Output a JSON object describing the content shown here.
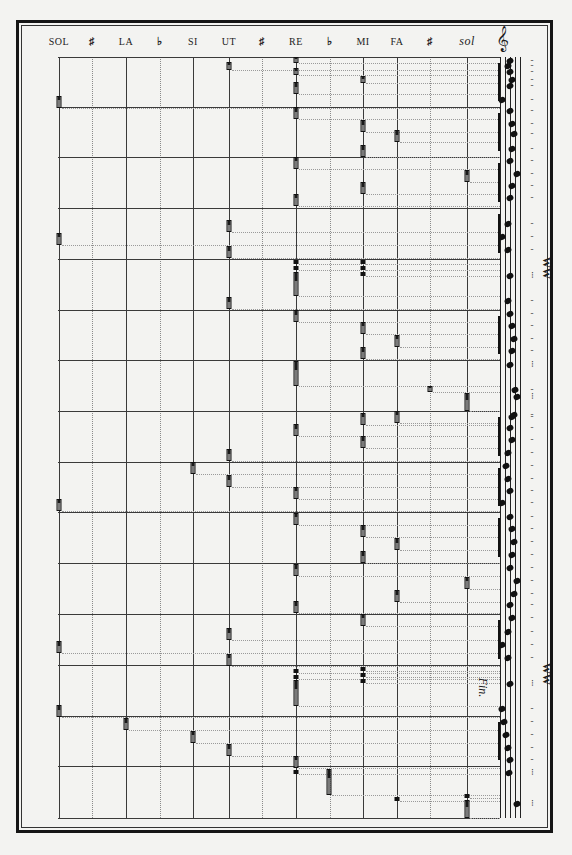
{
  "header": {
    "columns": [
      {
        "label": "SOL",
        "x": 59,
        "kind": "natural"
      },
      {
        "label": "♯",
        "x": 92,
        "kind": "accidental"
      },
      {
        "label": "LA",
        "x": 126,
        "kind": "natural"
      },
      {
        "label": "♭",
        "x": 160,
        "kind": "accidental"
      },
      {
        "label": "SI",
        "x": 193,
        "kind": "natural"
      },
      {
        "label": "UT",
        "x": 229,
        "kind": "natural"
      },
      {
        "label": "♯",
        "x": 262,
        "kind": "accidental"
      },
      {
        "label": "RE",
        "x": 296,
        "kind": "natural"
      },
      {
        "label": "♭",
        "x": 330,
        "kind": "accidental"
      },
      {
        "label": "MI",
        "x": 363,
        "kind": "natural"
      },
      {
        "label": "FA",
        "x": 397,
        "kind": "natural"
      },
      {
        "label": "♯",
        "x": 430,
        "kind": "accidental"
      },
      {
        "label": "sol",
        "x": 467,
        "kind": "italic"
      }
    ]
  },
  "grid": {
    "measure_lines_y": [
      57,
      107,
      157,
      208,
      259,
      310,
      360,
      411,
      462,
      512,
      563,
      614,
      665,
      716,
      766,
      818
    ],
    "solid_columns_x": [
      59,
      126,
      193,
      229,
      296,
      363,
      397,
      467,
      500
    ],
    "dotted_columns_x": [
      92,
      160,
      262,
      330,
      430
    ]
  },
  "pins": [
    {
      "x": 229,
      "y": 62,
      "h": 8
    },
    {
      "x": 296,
      "y": 57,
      "h": 6
    },
    {
      "x": 296,
      "y": 68,
      "h": 7
    },
    {
      "x": 296,
      "y": 82,
      "h": 12
    },
    {
      "x": 363,
      "y": 76,
      "h": 7
    },
    {
      "x": 59,
      "y": 96,
      "h": 12
    },
    {
      "x": 296,
      "y": 107,
      "h": 12
    },
    {
      "x": 363,
      "y": 120,
      "h": 12
    },
    {
      "x": 363,
      "y": 145,
      "h": 12
    },
    {
      "x": 397,
      "y": 130,
      "h": 12
    },
    {
      "x": 296,
      "y": 157,
      "h": 12
    },
    {
      "x": 363,
      "y": 182,
      "h": 12
    },
    {
      "x": 467,
      "y": 170,
      "h": 12
    },
    {
      "x": 296,
      "y": 194,
      "h": 12
    },
    {
      "x": 229,
      "y": 220,
      "h": 12
    },
    {
      "x": 229,
      "y": 246,
      "h": 12
    },
    {
      "x": 59,
      "y": 233,
      "h": 12
    },
    {
      "x": 296,
      "y": 260,
      "h": 4,
      "type": "dot"
    },
    {
      "x": 296,
      "y": 266,
      "h": 4,
      "type": "dot"
    },
    {
      "x": 296,
      "y": 272,
      "h": 24
    },
    {
      "x": 363,
      "y": 260,
      "h": 4,
      "type": "dot"
    },
    {
      "x": 363,
      "y": 266,
      "h": 4,
      "type": "dot"
    },
    {
      "x": 363,
      "y": 272,
      "h": 4,
      "type": "dot"
    },
    {
      "x": 229,
      "y": 297,
      "h": 12
    },
    {
      "x": 296,
      "y": 310,
      "h": 12
    },
    {
      "x": 363,
      "y": 322,
      "h": 12
    },
    {
      "x": 363,
      "y": 347,
      "h": 12
    },
    {
      "x": 397,
      "y": 335,
      "h": 12
    },
    {
      "x": 296,
      "y": 361,
      "h": 25
    },
    {
      "x": 430,
      "y": 386,
      "h": 6
    },
    {
      "x": 467,
      "y": 393,
      "h": 18
    },
    {
      "x": 296,
      "y": 424,
      "h": 12
    },
    {
      "x": 363,
      "y": 413,
      "h": 12
    },
    {
      "x": 363,
      "y": 436,
      "h": 12
    },
    {
      "x": 397,
      "y": 411,
      "h": 12
    },
    {
      "x": 229,
      "y": 449,
      "h": 12
    },
    {
      "x": 229,
      "y": 475,
      "h": 12
    },
    {
      "x": 193,
      "y": 462,
      "h": 12
    },
    {
      "x": 59,
      "y": 499,
      "h": 12
    },
    {
      "x": 296,
      "y": 487,
      "h": 12
    },
    {
      "x": 296,
      "y": 513,
      "h": 12
    },
    {
      "x": 363,
      "y": 525,
      "h": 12
    },
    {
      "x": 363,
      "y": 551,
      "h": 12
    },
    {
      "x": 397,
      "y": 538,
      "h": 12
    },
    {
      "x": 296,
      "y": 564,
      "h": 12
    },
    {
      "x": 467,
      "y": 577,
      "h": 12
    },
    {
      "x": 397,
      "y": 590,
      "h": 12
    },
    {
      "x": 296,
      "y": 601,
      "h": 12
    },
    {
      "x": 363,
      "y": 614,
      "h": 12
    },
    {
      "x": 229,
      "y": 628,
      "h": 12
    },
    {
      "x": 229,
      "y": 654,
      "h": 12
    },
    {
      "x": 59,
      "y": 641,
      "h": 12
    },
    {
      "x": 296,
      "y": 669,
      "h": 4,
      "type": "dot"
    },
    {
      "x": 296,
      "y": 675,
      "h": 4,
      "type": "dot"
    },
    {
      "x": 296,
      "y": 680,
      "h": 26
    },
    {
      "x": 363,
      "y": 667,
      "h": 4,
      "type": "dot"
    },
    {
      "x": 363,
      "y": 673,
      "h": 4,
      "type": "dot"
    },
    {
      "x": 363,
      "y": 679,
      "h": 4,
      "type": "dot"
    },
    {
      "x": 59,
      "y": 705,
      "h": 12
    },
    {
      "x": 126,
      "y": 718,
      "h": 12
    },
    {
      "x": 193,
      "y": 731,
      "h": 12
    },
    {
      "x": 229,
      "y": 744,
      "h": 12
    },
    {
      "x": 296,
      "y": 756,
      "h": 12
    },
    {
      "x": 296,
      "y": 770,
      "h": 4,
      "type": "dot"
    },
    {
      "x": 329,
      "y": 769,
      "h": 26
    },
    {
      "x": 397,
      "y": 797,
      "h": 4,
      "type": "dot"
    },
    {
      "x": 467,
      "y": 794,
      "h": 4,
      "type": "dot"
    },
    {
      "x": 467,
      "y": 800,
      "h": 18
    }
  ],
  "staff": {
    "lines_x": [
      500,
      505,
      510,
      515,
      520
    ],
    "clef": "𝄞",
    "ending_label": "Fin."
  }
}
